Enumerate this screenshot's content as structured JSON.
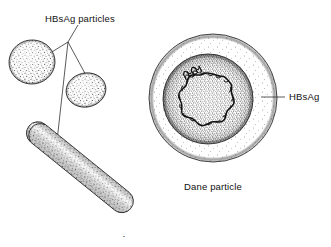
{
  "figure": {
    "title_label": "HBsAg particles",
    "envelope_label": "HBsAg",
    "caption": "Dane particle",
    "page_mark": "·",
    "background_color": "#ffffff",
    "ink_color": "#111111"
  },
  "diagram_data": {
    "type": "diagram",
    "subject": "Hepatitis B virus particle morphology",
    "style": "black-and-white stipple line drawing",
    "labels": [
      {
        "name": "hbsag-particles-label",
        "text": "HBsAg particles",
        "x": 80,
        "y": 18,
        "anchor": "middle",
        "points_to": [
          "spherical-particle-1",
          "spherical-particle-2",
          "filamentous-particle"
        ]
      },
      {
        "name": "hbsag-envelope-label",
        "text": "HBsAg",
        "x": 288,
        "y": 100,
        "anchor": "start",
        "points_to": [
          "dane-envelope"
        ]
      },
      {
        "name": "dane-particle-caption",
        "text": "Dane particle",
        "x": 213,
        "y": 188,
        "anchor": "middle",
        "points_to": [
          "dane-particle"
        ]
      }
    ],
    "shapes": [
      {
        "name": "spherical-particle-1",
        "kind": "sphere",
        "cx": 32,
        "cy": 62,
        "rx": 23,
        "ry": 22,
        "rotation": -8,
        "fill": "stipple"
      },
      {
        "name": "spherical-particle-2",
        "kind": "sphere",
        "cx": 86,
        "cy": 90,
        "rx": 20,
        "ry": 17,
        "rotation": -12,
        "fill": "stipple"
      },
      {
        "name": "filamentous-particle",
        "kind": "rod",
        "x1": 29,
        "y1": 126,
        "x2": 130,
        "y2": 208,
        "width": 23,
        "rotation": 39,
        "fill": "stipple"
      },
      {
        "name": "dane-envelope",
        "kind": "circle",
        "cx": 213,
        "cy": 98,
        "r": 64,
        "fill": "stipple-ring"
      },
      {
        "name": "dane-core",
        "kind": "circle",
        "cx": 208,
        "cy": 99,
        "r": 45,
        "fill": "stipple-dense"
      },
      {
        "name": "dane-dna-circle",
        "kind": "coiled-circle",
        "cx": 206,
        "cy": 101,
        "r": 28,
        "coils": 26
      },
      {
        "name": "dane-helix",
        "kind": "helix",
        "cx": 193,
        "cy": 73,
        "length": 18,
        "turns": 5,
        "rotation": -28
      }
    ],
    "leader_lines": [
      {
        "name": "leader-junction",
        "x": 68,
        "y": 42
      },
      {
        "name": "leader-to-sphere-1",
        "x1": 68,
        "y1": 42,
        "x2": 35,
        "y2": 63
      },
      {
        "name": "leader-to-sphere-2",
        "x1": 68,
        "y1": 42,
        "x2": 88,
        "y2": 79
      },
      {
        "name": "leader-to-rod",
        "x1": 68,
        "y1": 42,
        "x2": 57,
        "y2": 140
      },
      {
        "name": "leader-title-stem",
        "x1": 68,
        "y1": 42,
        "x2": 78,
        "y2": 24
      },
      {
        "name": "leader-to-envelope",
        "x1": 284,
        "y1": 97,
        "x2": 261,
        "y2": 97
      }
    ]
  }
}
